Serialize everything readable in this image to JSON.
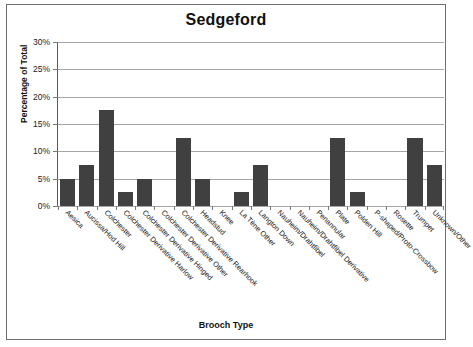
{
  "chart_data": {
    "type": "bar",
    "title": "Sedgeford",
    "xlabel": "Brooch Type",
    "ylabel": "Percentage of Total",
    "ylim": [
      0,
      30
    ],
    "ytick_labels": [
      "30%",
      "25%",
      "20%",
      "15%",
      "10%",
      "5%",
      "0%"
    ],
    "ytick_values": [
      30,
      25,
      20,
      15,
      10,
      5,
      0
    ],
    "grid": "horizontal",
    "legend": "none",
    "bar_color": "#404040",
    "categories": [
      "Aesica",
      "Aucissa/Hod Hill",
      "Colchester",
      "Colchester Derivative Harlow",
      "Colchester Derivative Hinged",
      "Colchester Derivative Other",
      "Colchester Derivative Rearhook",
      "Headstud",
      "Knee",
      "La Tène Other",
      "Langton Down",
      "Nauheim/Drahtfibel",
      "Nauheim/Drahtfibel Derivative",
      "Penannular",
      "Plate",
      "Polden Hill",
      "P-shaped/Proto-Crossbow",
      "Rosette",
      "Trumpet",
      "Unknown/Other"
    ],
    "values": [
      5,
      7.5,
      17.5,
      2.5,
      5,
      0,
      12.5,
      5,
      0,
      2.5,
      7.5,
      0,
      0,
      0,
      12.5,
      2.5,
      0,
      0,
      12.5,
      7.5
    ]
  }
}
